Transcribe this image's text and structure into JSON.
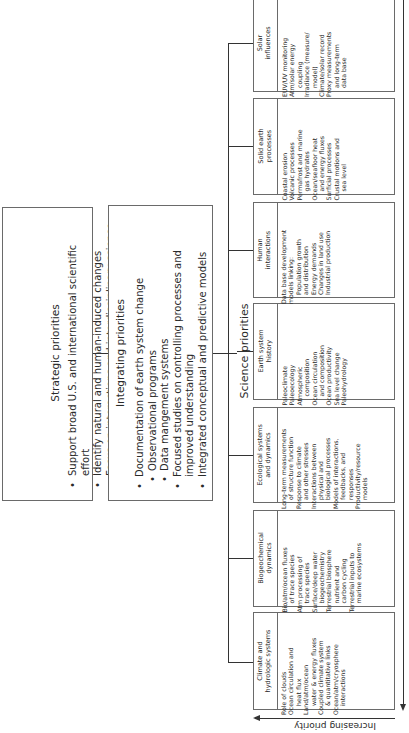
{
  "strategic": {
    "title": "Strategic priorities",
    "items": [
      "Support broad U.S. and international scientific effort",
      "Identify natural and human-induced changes",
      "Focus on interactions and interdisciplinary science",
      "Share financial burden, use the best resources, and",
      "encourage full participation"
    ]
  },
  "integrating": {
    "title": "Integrating priorities",
    "items": [
      "Documentation of earth system change",
      "Observational programs",
      "Data mangement systems",
      "Focused studies on controlling processes and",
      "improved understanding",
      "Integrated conceptual and predictive models"
    ]
  },
  "science": {
    "label": "Science priorities",
    "columns": [
      {
        "title": [
          "Climate and",
          "hydrologic systems"
        ],
        "lines": [
          "Role of clouds",
          "Ocean circulation and",
          "  heat flux",
          "Land/atm/ocean",
          "  water & energy fluxes",
          "Coupled climate system",
          "  & quantitative links",
          "Ocean/atm/cryosphere",
          "  interactions"
        ]
      },
      {
        "title": [
          "Biogeochemical",
          "dynamics"
        ],
        "lines": [
          "Bio/atm/ocean fluxes",
          "  of trace species",
          "Atm processing of",
          "  trace species",
          "Surface/deep water",
          "  biogeochemistry",
          "Terrestrial biosphere",
          "  nutrient and",
          "  carbon cycling",
          "Terrestrial inputs to",
          "  marine ecosystems"
        ]
      },
      {
        "title": [
          "Ecological systems",
          "and dynamics"
        ],
        "lines": [
          "Long-term measurements",
          "  of structure function",
          "Response to climate",
          "  and other stresses",
          "Interactions between",
          "  physical and",
          "  biological processes",
          "Models of interactions,",
          "  feedbacks, and",
          "  responses",
          "Productivity/resource",
          "  models"
        ]
      },
      {
        "title": [
          "Earth system",
          "history"
        ],
        "lines": [
          "Paleoclimate",
          "Paleoecology",
          "Atmospheric",
          "  composition",
          "Ocean circulation",
          "  and composition",
          "Ocean productivity",
          "Sea level change",
          "Paleohydrology"
        ]
      },
      {
        "title": [
          "Human",
          "interactions"
        ],
        "lines": [
          "Data base development",
          "models linking:",
          "  Population growth",
          "  and distribution",
          "  Energy demands",
          "  Changes in land use",
          "  Industrial production"
        ]
      },
      {
        "title": [
          "Solid earth",
          "processes"
        ],
        "lines": [
          "Coastal erosion",
          "Volcanic processes",
          "Permafrost and marine",
          "  gas hydrates",
          "Ocean/seafloor heat",
          "  and energy fluxes",
          "Surficial processes",
          "Crustal motions and",
          "  sea level"
        ]
      },
      {
        "title": [
          "Solar",
          "influences"
        ],
        "lines": [
          "EUV/UV monitoring",
          "Atm/solar energy",
          "  coupling",
          "Irradiance (measure/",
          "  model)",
          "Climate/solar record",
          "Proxy measurements",
          "  and long-term",
          "  data base"
        ]
      }
    ]
  },
  "axis": {
    "label": "Increasing priority"
  },
  "colors": {
    "line": "#333333",
    "box_border": "#6a6a6a",
    "text": "#2a2a2a"
  }
}
